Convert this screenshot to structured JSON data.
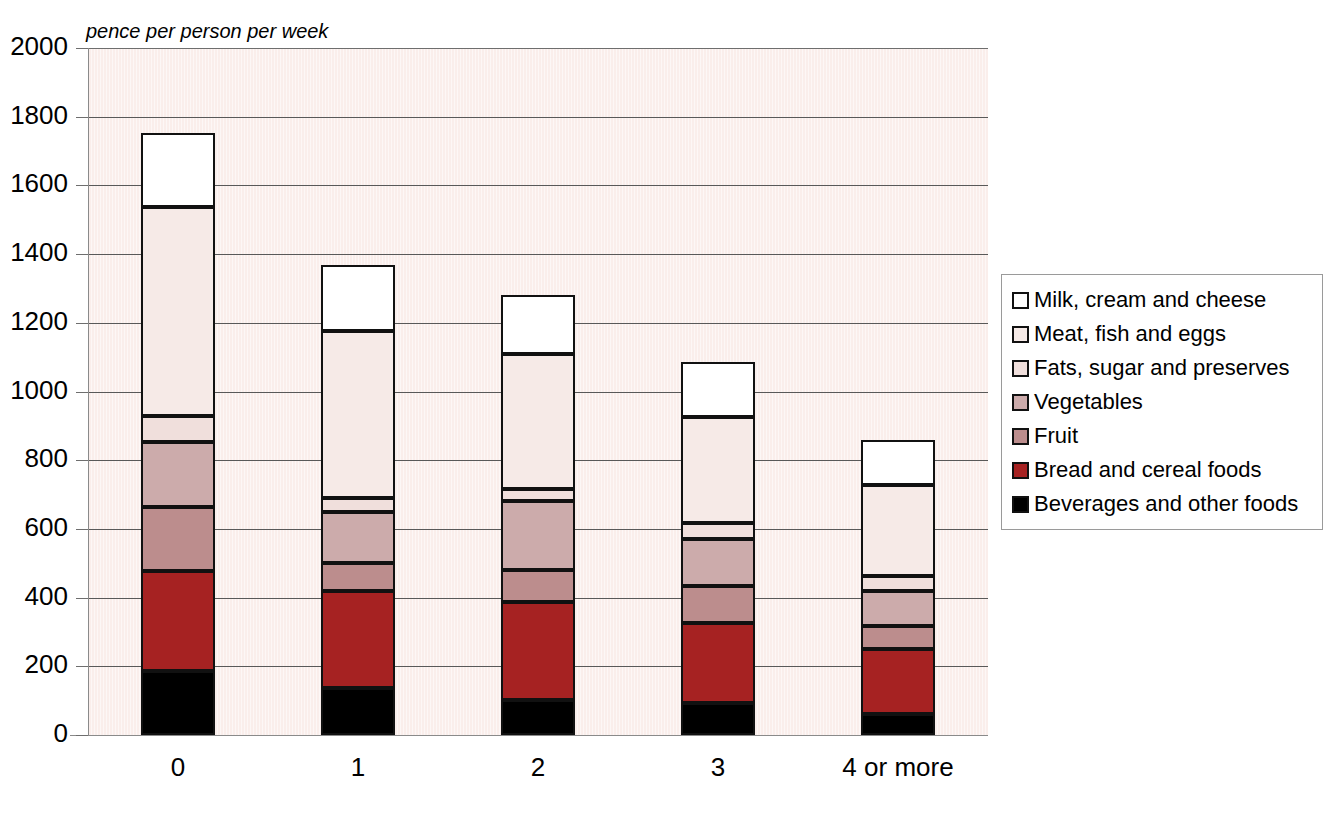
{
  "chart_data": {
    "type": "bar",
    "subtype": "stacked-bar",
    "title": "",
    "subtitle": "",
    "axis_note": "pence per person per week",
    "xlabel": "",
    "ylabel": "pence per person per week",
    "categories": [
      "0",
      "1",
      "2",
      "3",
      "4 or more"
    ],
    "ylim": [
      0,
      2000
    ],
    "yticks": [
      0,
      200,
      400,
      600,
      800,
      1000,
      1200,
      1400,
      1600,
      1800,
      2000
    ],
    "ytick_labels": [
      "0",
      "200",
      "400",
      "600",
      "800",
      "1000",
      "1200",
      "1400",
      "1600",
      "1800",
      "2000"
    ],
    "grid": true,
    "legend_position": "right",
    "stack_order_bottom_to_top": [
      "Beverages and other foods",
      "Bread and cereal foods",
      "Fruit",
      "Vegetables",
      "Fats, sugar and preserves",
      "Meat, fish and eggs",
      "Milk, cream and cheese"
    ],
    "series": [
      {
        "name": "Milk, cream and cheese",
        "color": "#ffffff",
        "values": [
          215,
          192,
          172,
          160,
          130
        ]
      },
      {
        "name": "Meat, fish and eggs",
        "color": "#f6eae7",
        "values": [
          610,
          485,
          395,
          310,
          265
        ]
      },
      {
        "name": "Fats, sugar and preserves",
        "color": "#f0dfdc",
        "values": [
          75,
          40,
          35,
          46,
          44
        ]
      },
      {
        "name": "Vegetables",
        "color": "#ccabab",
        "values": [
          190,
          150,
          200,
          137,
          102
        ]
      },
      {
        "name": "Fruit",
        "color": "#bc8d8d",
        "values": [
          186,
          80,
          93,
          108,
          67
        ]
      },
      {
        "name": "Bread and cereal foods",
        "color": "#a62222",
        "values": [
          291,
          283,
          285,
          233,
          189
        ]
      },
      {
        "name": "Beverages and other foods",
        "color": "#000000",
        "values": [
          186,
          137,
          102,
          93,
          61
        ]
      }
    ],
    "totals": [
      1753,
      1367,
      1282,
      1087,
      858
    ],
    "bar_tops": [
      1812,
      1467,
      1277,
      1080,
      857
    ]
  },
  "legend": {
    "items": [
      {
        "label": "Milk, cream and cheese",
        "color": "#ffffff"
      },
      {
        "label": "Meat, fish and eggs",
        "color": "#f6eae7"
      },
      {
        "label": "Fats, sugar and preserves",
        "color": "#f0dfdc"
      },
      {
        "label": "Vegetables",
        "color": "#ccabab"
      },
      {
        "label": "Fruit",
        "color": "#bc8d8d"
      },
      {
        "label": "Bread and cereal foods",
        "color": "#a62222"
      },
      {
        "label": "Beverages and other foods",
        "color": "#000000"
      }
    ]
  },
  "colors": {
    "plot_background": "#faeeeb",
    "gridline": "#595959",
    "bar_outline": "#111111",
    "page_background": "#ffffff"
  }
}
